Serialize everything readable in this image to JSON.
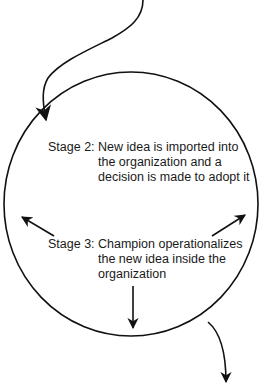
{
  "diagram": {
    "type": "cycle-stage-diagram",
    "stroke_color": "#111111",
    "background": "#ffffff",
    "stages": [
      {
        "label": "Stage 2:",
        "lines": [
          "New idea is imported into",
          "the organization and a",
          "decision is made to adopt it"
        ]
      },
      {
        "label": "Stage 3:",
        "lines": [
          "Champion operationalizes",
          "the new idea inside the",
          "organization"
        ]
      }
    ],
    "arrows": [
      {
        "name": "incoming-arrow",
        "description": "curved arrow from top entering circle at upper-left"
      },
      {
        "name": "left-arrow",
        "description": "arrow from Stage 3 pointing up-left"
      },
      {
        "name": "right-arrow",
        "description": "arrow from Stage 3 pointing up-right"
      },
      {
        "name": "down-arrow",
        "description": "arrow from Stage 3 pointing down"
      },
      {
        "name": "outgoing-arrow",
        "description": "curved arrow leaving circle at lower-right going down"
      }
    ]
  }
}
